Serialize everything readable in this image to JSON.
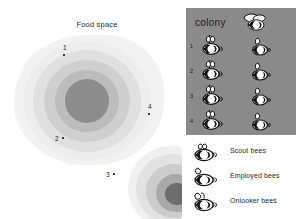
{
  "food_space": {
    "title": "Food space",
    "markers": [
      {
        "label": "1"
      },
      {
        "label": "2"
      },
      {
        "label": "3"
      },
      {
        "label": "4"
      }
    ],
    "ring_colors": [
      "#f2f2f2",
      "#ededed",
      "#e0e0e0",
      "#cfcfcf",
      "#bcbcbc",
      "#8d8d8d"
    ]
  },
  "colony": {
    "title": "colony",
    "title_icon": "flying-bee-icon",
    "panel_color": "#8a8a8a",
    "rows": [
      {
        "number": "1",
        "left_icon": "scout-bee-icon",
        "right_icon": "onlooker-bee-icon"
      },
      {
        "number": "2",
        "left_icon": "scout-bee-icon",
        "right_icon": "onlooker-bee-icon"
      },
      {
        "number": "3",
        "left_icon": "scout-bee-icon",
        "right_icon": "onlooker-bee-icon"
      },
      {
        "number": "4",
        "left_icon": "scout-bee-icon",
        "right_icon": "onlooker-bee-icon"
      }
    ]
  },
  "legend": {
    "items": [
      {
        "label": "Scout bees",
        "icon": "scout-bee-icon"
      },
      {
        "label": "Employed bees",
        "icon": "employed-bee-icon"
      },
      {
        "label": "Onlooker bees",
        "icon": "onlooker-bee-icon"
      }
    ]
  }
}
